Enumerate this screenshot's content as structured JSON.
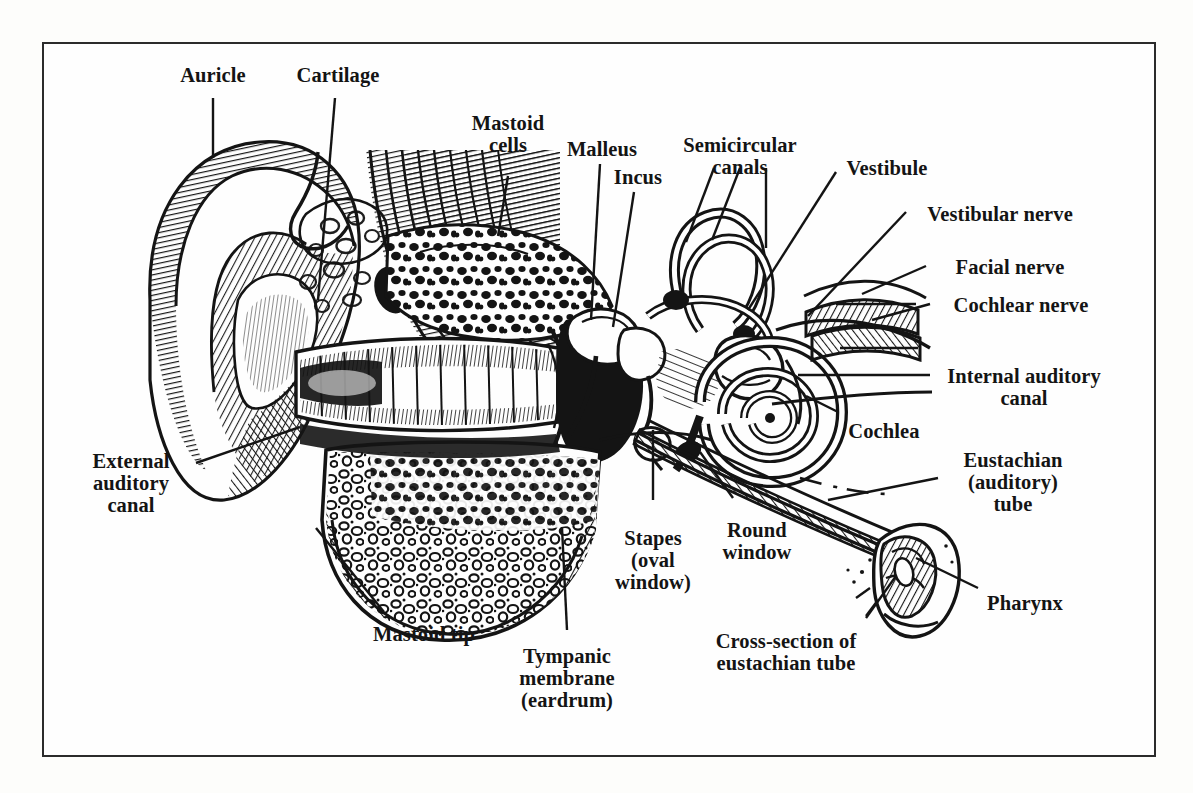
{
  "figure": {
    "kind": "anatomical-illustration",
    "style": "black-and-white engraving / line drawing",
    "frame": {
      "border_color": "#2b2b2b",
      "background": "#fefefe"
    },
    "ink_color": "#141414"
  },
  "labels": [
    {
      "id": "auricle",
      "text": "Auricle",
      "x": 213,
      "y": 64,
      "align": "c"
    },
    {
      "id": "cartilage",
      "text": "Cartilage",
      "x": 338,
      "y": 64,
      "align": "c"
    },
    {
      "id": "mastoid-cells",
      "text": "Mastoid\ncells",
      "x": 508,
      "y": 112,
      "align": "c"
    },
    {
      "id": "malleus",
      "text": "Malleus",
      "x": 602,
      "y": 138,
      "align": "c"
    },
    {
      "id": "incus",
      "text": "Incus",
      "x": 638,
      "y": 166,
      "align": "c"
    },
    {
      "id": "semicircular-canals",
      "text": "Semicircular\ncanals",
      "x": 740,
      "y": 134,
      "align": "c"
    },
    {
      "id": "vestibule",
      "text": "Vestibule",
      "x": 887,
      "y": 157,
      "align": "c"
    },
    {
      "id": "vestibular-nerve",
      "text": "Vestibular nerve",
      "x": 1000,
      "y": 203,
      "align": "c"
    },
    {
      "id": "facial-nerve",
      "text": "Facial nerve",
      "x": 1010,
      "y": 256,
      "align": "c"
    },
    {
      "id": "cochlear-nerve",
      "text": "Cochlear nerve",
      "x": 1021,
      "y": 294,
      "align": "c"
    },
    {
      "id": "internal-auditory-canal",
      "text": "Internal auditory\ncanal",
      "x": 1024,
      "y": 365,
      "align": "c"
    },
    {
      "id": "cochlea",
      "text": "Cochlea",
      "x": 884,
      "y": 420,
      "align": "c"
    },
    {
      "id": "external-auditory-canal",
      "text": "External\nauditory\ncanal",
      "x": 131,
      "y": 450,
      "align": "c"
    },
    {
      "id": "eustachian-tube",
      "text": "Eustachian\n(auditory)\ntube",
      "x": 1013,
      "y": 449,
      "align": "c"
    },
    {
      "id": "stapes",
      "text": "Stapes\n(oval\nwindow)",
      "x": 653,
      "y": 527,
      "align": "c"
    },
    {
      "id": "round-window",
      "text": "Round\nwindow",
      "x": 757,
      "y": 519,
      "align": "c"
    },
    {
      "id": "pharynx",
      "text": "Pharynx",
      "x": 1025,
      "y": 592,
      "align": "c"
    },
    {
      "id": "mastoid-tip",
      "text": "Mastoid tip",
      "x": 424,
      "y": 623,
      "align": "c"
    },
    {
      "id": "tympanic-membrane",
      "text": "Tympanic\nmembrane\n(eardrum)",
      "x": 567,
      "y": 645,
      "align": "c"
    },
    {
      "id": "cross-section-eustachian",
      "text": "Cross-section of\neustachian tube",
      "x": 786,
      "y": 630,
      "align": "c"
    }
  ],
  "leaders": [
    {
      "id": "leader-auricle",
      "points": "213,98 213,158"
    },
    {
      "id": "leader-cartilage",
      "points": "335,98 318,300"
    },
    {
      "id": "leader-mastoid-cells",
      "points": "508,176 498,236"
    },
    {
      "id": "leader-malleus",
      "points": "600,164 591,320"
    },
    {
      "id": "leader-incus",
      "points": "634,192 613,327"
    },
    {
      "id": "leader-semicircular-1",
      "points": "714,168 686,242"
    },
    {
      "id": "leader-semicircular-2",
      "points": "740,168 712,240"
    },
    {
      "id": "leader-semicircular-3",
      "points": "766,168 766,248"
    },
    {
      "id": "leader-vestibule",
      "points": "836,172 748,310"
    },
    {
      "id": "leader-vestibular-nerve",
      "points": "906,212 808,316"
    },
    {
      "id": "leader-facial-nerve",
      "points": "926,266 862,294"
    },
    {
      "id": "leader-cochlear-nerve",
      "points": "930,304 872,320"
    },
    {
      "id": "leader-internal-auditory",
      "points": "930,375 798,375"
    },
    {
      "id": "leader-cochlea",
      "points": "838,412 806,396"
    },
    {
      "id": "leader-external-auditory",
      "points": "196,463 300,427"
    },
    {
      "id": "leader-eustachian",
      "points": "938,478 828,500"
    },
    {
      "id": "leader-stapes",
      "points": "653,500 653,430"
    },
    {
      "id": "leader-round-window",
      "points": "733,498 700,452"
    },
    {
      "id": "leader-pharynx",
      "points": "978,588 916,558"
    },
    {
      "id": "leader-mastoid-tip",
      "points": "384,612 316,528"
    },
    {
      "id": "leader-tympanic",
      "points": "567,630 562,528"
    },
    {
      "id": "leader-cross-section",
      "points": "866,618 896,576"
    }
  ]
}
